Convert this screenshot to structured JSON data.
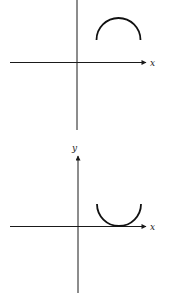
{
  "figures": [
    {
      "name": "top-graph",
      "axis_labels": {
        "x": "x",
        "y": ""
      },
      "curve": "upper semicircle (arc opening downward) above x-axis in first quadrant",
      "axes": {
        "origin": [
          77,
          62
        ],
        "x_from": 10,
        "x_to": 146,
        "y_from": 0,
        "y_to": 130
      },
      "arc": {
        "cx": 118.5,
        "cy": 40,
        "r": 22,
        "orientation": "up"
      }
    },
    {
      "name": "bottom-graph",
      "axis_labels": {
        "x": "x",
        "y": "y"
      },
      "curve": "lower semicircle (arc opening upward) tangent to x-axis in first quadrant",
      "axes": {
        "origin": [
          78,
          226
        ],
        "x_from": 10,
        "x_to": 146,
        "y_from": 155,
        "y_to": 293
      },
      "arc": {
        "cx": 119,
        "cy": 204,
        "r": 22,
        "orientation": "down"
      }
    }
  ],
  "colors": {
    "axis": "#1a1a1a",
    "curve": "#111111",
    "background": "#ffffff"
  }
}
